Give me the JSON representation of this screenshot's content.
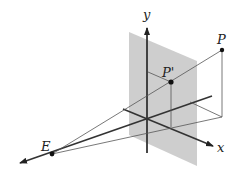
{
  "diagram": {
    "labels": {
      "y_axis": "y",
      "x_axis": "x",
      "point_p": "P",
      "point_p_prime": "P'",
      "eye": "E"
    },
    "colors": {
      "plane": "#c8c8c8",
      "axis": "#333333",
      "line": "#555555",
      "point": "#111111"
    }
  }
}
